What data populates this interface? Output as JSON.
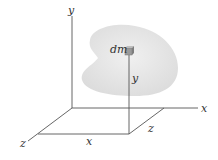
{
  "diagram": {
    "labels": {
      "y_axis": "y",
      "x_axis": "x",
      "z_axis": "z",
      "element": "dm",
      "height": "y",
      "x_dist": "x",
      "z_dist": "z"
    },
    "colors": {
      "line": "#555555",
      "body_fill": "#e6e6e6",
      "element_fill": "#9a9a9a"
    }
  }
}
